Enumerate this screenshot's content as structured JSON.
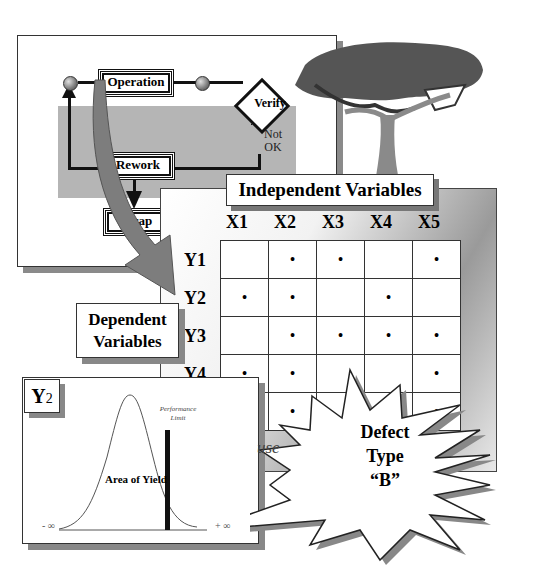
{
  "process_flow": {
    "operation_label": "Operation",
    "verify_label": "Verify",
    "not_ok_label": "Not OK",
    "rework_label": "Rework",
    "scrap_label": "Scrap"
  },
  "matrix": {
    "title": "Independent Variables",
    "columns": [
      "X1",
      "X2",
      "X3",
      "X4",
      "X5"
    ],
    "rows": [
      {
        "label": "Y1",
        "cells": [
          "",
          "•",
          "•",
          "",
          "•"
        ]
      },
      {
        "label": "Y2",
        "cells": [
          "•",
          "•",
          "",
          "•",
          ""
        ]
      },
      {
        "label": "Y3",
        "cells": [
          "",
          "•",
          "•",
          "•",
          "•"
        ]
      },
      {
        "label": "Y4",
        "cells": [
          "•",
          "•",
          "",
          "",
          "•"
        ]
      },
      {
        "label": "Y5",
        "cells": [
          "",
          "•",
          "",
          "",
          "•"
        ]
      }
    ]
  },
  "dependent_label_line1": "Dependent",
  "dependent_label_line2": "Variables",
  "distribution": {
    "variable_label": "Y",
    "variable_subscript": "2",
    "limit_label_line1": "Performance",
    "limit_label_line2": "Limit",
    "area_label": "Area of Yield",
    "left_axis_label": "- ∞",
    "right_axis_label": "+ ∞"
  },
  "defect_callout": {
    "line1": "Defect",
    "line2": "Type",
    "line3": "“B”",
    "partial_word": "use"
  }
}
